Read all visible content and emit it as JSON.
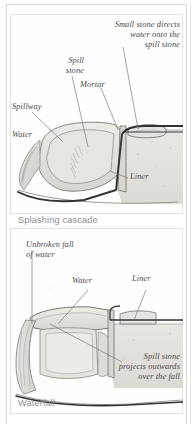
{
  "document": {
    "type": "illustration-plate",
    "panel_count": 2
  },
  "panels": [
    {
      "id": "splashing-cascade",
      "caption": "Splashing cascade",
      "labels": [
        {
          "id": "small-stone-note",
          "text": "Small stone directs\nwater onto the\nspill stone"
        },
        {
          "id": "spill-stone",
          "text": "Spill\nstone"
        },
        {
          "id": "spillway",
          "text": "Spillway"
        },
        {
          "id": "mortar",
          "text": "Mortar"
        },
        {
          "id": "water",
          "text": "Water"
        },
        {
          "id": "liner",
          "text": "Liner"
        }
      ]
    },
    {
      "id": "waterfall",
      "caption": "Waterfall",
      "labels": [
        {
          "id": "unbroken-fall",
          "text": "Unbroken fall\nof water"
        },
        {
          "id": "water",
          "text": "Water"
        },
        {
          "id": "liner",
          "text": "Liner"
        },
        {
          "id": "spill-stone-note",
          "text": "Spill stone\nprojects outwards\nover the fall"
        }
      ]
    }
  ],
  "colors": {
    "stone_fill": "#dedcd8",
    "stone_fill_light": "#eceae6",
    "ground_fill": "#e6e4e0",
    "liner_stroke": "#3a3a3a",
    "outline": "#6f6f6f",
    "label_text": "#4a4a4a",
    "caption_text": "#8e8e8e",
    "page_bg": "#ffffff",
    "rule": "#d8d8d8"
  }
}
